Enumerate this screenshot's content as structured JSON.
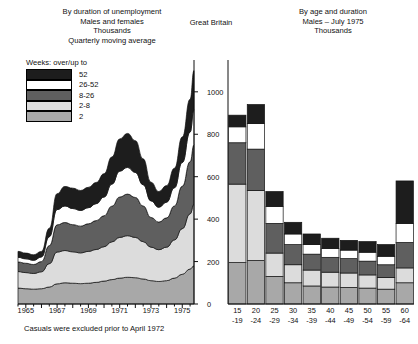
{
  "titles": {
    "left_l1": "By duration of unemployment",
    "left_l2": "Males and females",
    "left_l3": "Thousands",
    "left_l4": "Quarterly moving average",
    "center": "Great Britain",
    "right_l1": "By age and duration",
    "right_l2": "Males – July 1975",
    "right_l3": "Thousands"
  },
  "legend": {
    "heading": "Weeks: over/up to",
    "items": [
      {
        "label": "52",
        "color": "#1d1d1d",
        "key": "w52"
      },
      {
        "label": "26-52",
        "color": "#ffffff",
        "key": "w2652"
      },
      {
        "label": "8-26",
        "color": "#5f5f5f",
        "key": "w826"
      },
      {
        "label": "2-8",
        "color": "#dcdcdc",
        "key": "w28"
      },
      {
        "label": "2",
        "color": "#a8a8a8",
        "key": "w2"
      }
    ]
  },
  "footnote": "Casuals were excluded prior to April 1972",
  "axis": {
    "y_ticks": [
      0,
      200,
      400,
      600,
      800,
      1000
    ],
    "y_max": 1150,
    "left_x_ticks": [
      "1965",
      "1967",
      "1969",
      "1971",
      "1973",
      "1975"
    ]
  },
  "chart_data": [
    {
      "type": "area",
      "id": "left-area-chart",
      "title": "By duration of unemployment",
      "subtitle": "Males and females – Thousands – Quarterly moving average",
      "xlabel": "",
      "ylabel": "Thousands",
      "ylim": [
        0,
        1150
      ],
      "xlim": [
        1964.5,
        1975.75
      ],
      "grid": false,
      "stacked": true,
      "legend_position": "top-left",
      "x": [
        1964.5,
        1965.0,
        1965.5,
        1966.0,
        1966.5,
        1967.0,
        1967.5,
        1968.0,
        1968.5,
        1969.0,
        1969.5,
        1970.0,
        1970.5,
        1971.0,
        1971.5,
        1972.0,
        1972.5,
        1973.0,
        1973.5,
        1974.0,
        1974.5,
        1975.0,
        1975.5,
        1975.75
      ],
      "series": [
        {
          "name": "2",
          "color": "#a8a8a8",
          "values": [
            75,
            72,
            70,
            72,
            80,
            95,
            100,
            98,
            96,
            98,
            102,
            108,
            115,
            122,
            126,
            124,
            118,
            110,
            106,
            110,
            122,
            140,
            165,
            180
          ]
        },
        {
          "name": "2-8",
          "color": "#dcdcdc",
          "values": [
            78,
            76,
            74,
            80,
            110,
            150,
            152,
            148,
            145,
            150,
            155,
            162,
            178,
            192,
            196,
            190,
            176,
            158,
            150,
            158,
            180,
            215,
            260,
            290
          ]
        },
        {
          "name": "8-26",
          "color": "#5f5f5f",
          "values": [
            45,
            44,
            42,
            48,
            85,
            128,
            132,
            128,
            126,
            130,
            136,
            146,
            168,
            190,
            196,
            188,
            168,
            140,
            130,
            138,
            160,
            200,
            245,
            280
          ]
        },
        {
          "name": "26-52",
          "color": "#ffffff",
          "values": [
            22,
            21,
            20,
            22,
            42,
            72,
            78,
            76,
            74,
            76,
            80,
            88,
            104,
            122,
            126,
            118,
            100,
            78,
            70,
            74,
            86,
            112,
            140,
            165
          ]
        },
        {
          "name": "52",
          "color": "#1d1d1d",
          "values": [
            28,
            27,
            26,
            26,
            40,
            75,
            92,
            96,
            94,
            96,
            100,
            110,
            128,
            152,
            160,
            150,
            122,
            88,
            74,
            78,
            92,
            120,
            155,
            185
          ]
        }
      ],
      "totals": [
        248,
        240,
        232,
        248,
        357,
        520,
        554,
        546,
        535,
        550,
        573,
        614,
        693,
        778,
        804,
        770,
        684,
        574,
        530,
        558,
        640,
        787,
        965,
        1100
      ],
      "note": "Casuals were excluded prior to April 1972"
    },
    {
      "type": "bar",
      "id": "right-bar-chart",
      "title": "By age and duration",
      "subtitle": "Males – July 1975 – Thousands",
      "stacked": true,
      "xlabel": "",
      "ylabel": "Thousands",
      "ylim": [
        0,
        1150
      ],
      "grid": false,
      "categories": [
        "15-19",
        "20-24",
        "25-29",
        "30-34",
        "35-39",
        "40-44",
        "45-49",
        "50-54",
        "55-59",
        "60-64"
      ],
      "category_lines": [
        {
          "top": "15",
          "bottom": "-19"
        },
        {
          "top": "20",
          "bottom": "-24"
        },
        {
          "top": "25",
          "bottom": "-29"
        },
        {
          "top": "30",
          "bottom": "-34"
        },
        {
          "top": "35",
          "bottom": "-39"
        },
        {
          "top": "40",
          "bottom": "-44"
        },
        {
          "top": "45",
          "bottom": "-49"
        },
        {
          "top": "50",
          "bottom": "-54"
        },
        {
          "top": "55",
          "bottom": "-59"
        },
        {
          "top": "60",
          "bottom": "-64"
        }
      ],
      "series": [
        {
          "name": "2",
          "color": "#a8a8a8",
          "values": [
            195,
            205,
            130,
            100,
            85,
            80,
            78,
            75,
            70,
            100
          ]
        },
        {
          "name": "2-8",
          "color": "#dcdcdc",
          "values": [
            370,
            330,
            110,
            85,
            75,
            70,
            68,
            62,
            55,
            70
          ]
        },
        {
          "name": "8-26",
          "color": "#5f5f5f",
          "values": [
            195,
            195,
            140,
            95,
            75,
            70,
            68,
            65,
            60,
            120
          ]
        },
        {
          "name": "26-52",
          "color": "#ffffff",
          "values": [
            75,
            120,
            80,
            50,
            45,
            42,
            40,
            42,
            40,
            90
          ]
        },
        {
          "name": "52",
          "color": "#1d1d1d",
          "values": [
            55,
            90,
            70,
            55,
            50,
            48,
            46,
            50,
            55,
            200
          ]
        }
      ],
      "totals": [
        890,
        940,
        530,
        385,
        330,
        310,
        300,
        294,
        280,
        580
      ]
    }
  ]
}
